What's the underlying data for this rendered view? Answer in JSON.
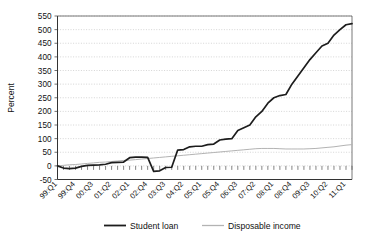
{
  "chart_data": {
    "type": "line",
    "title": "",
    "xlabel": "",
    "ylabel": "Percent",
    "ylim": [
      -50,
      550
    ],
    "ytick_step": 50,
    "yticks": [
      -50,
      0,
      50,
      100,
      150,
      200,
      250,
      300,
      350,
      400,
      450,
      500,
      550
    ],
    "grid": true,
    "legend_position": "bottom",
    "x": [
      "99:Q1",
      "99:Q2",
      "99:Q3",
      "99:Q4",
      "00:Q1",
      "00:Q2",
      "00:Q3",
      "00:Q4",
      "01:Q1",
      "01:Q2",
      "01:Q3",
      "01:Q4",
      "02:Q1",
      "02:Q2",
      "02:Q3",
      "02:Q4",
      "03:Q1",
      "03:Q2",
      "03:Q3",
      "03:Q4",
      "04:Q1",
      "04:Q2",
      "04:Q3",
      "04:Q4",
      "05:Q1",
      "05:Q2",
      "05:Q3",
      "05:Q4",
      "06:Q1",
      "06:Q2",
      "06:Q3",
      "06:Q4",
      "07:Q1",
      "07:Q2",
      "07:Q3",
      "07:Q4",
      "08:Q1",
      "08:Q2",
      "08:Q3",
      "08:Q4",
      "09:Q1",
      "09:Q2",
      "09:Q3",
      "09:Q4",
      "10:Q1",
      "10:Q2",
      "10:Q3",
      "10:Q4",
      "11:Q1",
      "11:Q2"
    ],
    "xtick_labels": [
      "99:Q1",
      "99:Q4",
      "00:Q3",
      "01:Q2",
      "02:Q1",
      "02:Q4",
      "03:Q3",
      "04:Q2",
      "05:Q1",
      "05:Q4",
      "06:Q3",
      "07:Q2",
      "08:Q1",
      "08:Q4",
      "09:Q3",
      "10:Q2",
      "11:Q1"
    ],
    "xtick_indices": [
      0,
      3,
      6,
      9,
      12,
      15,
      18,
      21,
      24,
      27,
      30,
      33,
      36,
      39,
      42,
      45,
      48
    ],
    "series": [
      {
        "name": "Student loan",
        "color": "#1d1d1d",
        "values": [
          0,
          -8,
          -10,
          -8,
          -2,
          2,
          3,
          4,
          6,
          12,
          13,
          14,
          30,
          32,
          32,
          31,
          -20,
          -18,
          -6,
          -5,
          58,
          60,
          70,
          72,
          72,
          78,
          80,
          95,
          98,
          100,
          130,
          140,
          150,
          180,
          200,
          230,
          250,
          258,
          262,
          300,
          330,
          360,
          390,
          415,
          440,
          450,
          480,
          500,
          518,
          522
        ]
      },
      {
        "name": "Disposable income",
        "color": "#b3b3b3",
        "values": [
          0,
          2,
          4,
          5,
          7,
          9,
          11,
          13,
          14,
          16,
          18,
          20,
          21,
          23,
          25,
          27,
          29,
          31,
          33,
          35,
          37,
          39,
          41,
          43,
          45,
          47,
          49,
          51,
          53,
          55,
          57,
          59,
          61,
          63,
          64,
          64,
          64,
          63,
          62,
          62,
          62,
          62,
          63,
          64,
          66,
          68,
          70,
          73,
          76,
          78
        ]
      }
    ]
  },
  "legend": {
    "items": [
      {
        "label": "Student loan",
        "color": "#1d1d1d"
      },
      {
        "label": "Disposable income",
        "color": "#b3b3b3"
      }
    ]
  },
  "axis": {
    "y_title": "Percent"
  }
}
